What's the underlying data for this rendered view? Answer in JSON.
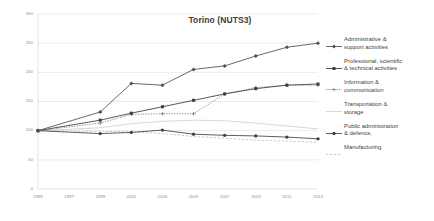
{
  "chart_data": {
    "type": "line",
    "title": "Torino (NUTS3)",
    "xlabel": "",
    "ylabel": "",
    "xlim": [
      1995,
      2013
    ],
    "ylim": [
      0,
      300
    ],
    "grid": true,
    "legend_position": "right",
    "x": [
      1995,
      1996,
      1997,
      1998,
      1999,
      2000,
      2001,
      2002,
      2003,
      2004,
      2005,
      2006,
      2007,
      2008,
      2009,
      2010,
      2011,
      2012,
      2013
    ],
    "xticks": [
      "1995",
      "1997",
      "1999",
      "2001",
      "2003",
      "2005",
      "2007",
      "2009",
      "2011",
      "2013"
    ],
    "yticks": [
      "0",
      "50",
      "100",
      "150",
      "200",
      "250",
      "300"
    ],
    "series": [
      {
        "name": "Administrative & support activities",
        "style": "solid",
        "marker": "diamond",
        "color": "#4f4f4f",
        "x": [
          1995,
          1999,
          2001,
          2003,
          2005,
          2007,
          2009,
          2011,
          2013
        ],
        "values": [
          100,
          132,
          181,
          178,
          205,
          211,
          228,
          243,
          250
        ]
      },
      {
        "name": "Professional, scientific & technical activities",
        "style": "solid",
        "marker": "square",
        "color": "#3a3a3a",
        "x": [
          1995,
          1999,
          2001,
          2003,
          2005,
          2007,
          2009,
          2011,
          2013
        ],
        "values": [
          100,
          118,
          130,
          141,
          152,
          163,
          172,
          178,
          180
        ]
      },
      {
        "name": "Information & communication",
        "style": "dotted",
        "marker": "plus",
        "color": "#7c7c7c",
        "x": [
          1995,
          1999,
          2001,
          2003,
          2005,
          2007,
          2009,
          2011,
          2013
        ],
        "values": [
          100,
          113,
          128,
          129,
          129,
          163,
          174,
          178,
          178
        ]
      },
      {
        "name": "Transportation & storage",
        "style": "solid-thin",
        "marker": "none",
        "color": "#bdbdbd",
        "x": [
          1995,
          1999,
          2001,
          2003,
          2005,
          2007,
          2009,
          2011,
          2013
        ],
        "values": [
          100,
          105,
          112,
          116,
          118,
          117,
          113,
          108,
          103
        ]
      },
      {
        "name": "Public administration & defence,",
        "style": "solid",
        "marker": "circle",
        "color": "#414141",
        "x": [
          1995,
          1999,
          2001,
          2003,
          2005,
          2007,
          2009,
          2011,
          2013
        ],
        "values": [
          100,
          95,
          97,
          101,
          94,
          92,
          91,
          89,
          86
        ]
      },
      {
        "name": "Manufacturing",
        "style": "dashed",
        "marker": "none",
        "color": "#c4c4c4",
        "x": [
          1995,
          1999,
          2001,
          2003,
          2005,
          2007,
          2009,
          2011,
          2013
        ],
        "values": [
          100,
          99,
          98,
          95,
          90,
          87,
          84,
          82,
          80
        ]
      }
    ]
  },
  "legend": {
    "items": [
      {
        "label": "Administrative &\nsupport activities",
        "marker": "diamond-line-marker"
      },
      {
        "label": "Professional, scientific\n& technical activities",
        "marker": "square-line-marker"
      },
      {
        "label": "Information &\ncommunication",
        "marker": "plus-line-marker"
      },
      {
        "label": "Transportation &\nstorage",
        "marker": "plain-line-marker"
      },
      {
        "label": "Public administration\n& defence,",
        "marker": "circle-line-marker"
      },
      {
        "label": "Manufacturing",
        "marker": "dashed-line-marker"
      }
    ]
  }
}
